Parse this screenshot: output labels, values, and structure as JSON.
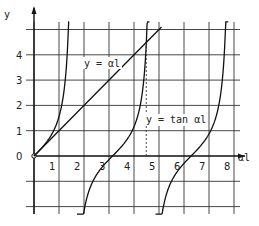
{
  "chart_data": {
    "type": "line",
    "title": "",
    "xlabel": "αl",
    "ylabel": "y",
    "xlim": [
      0,
      8.5
    ],
    "ylim": [
      -2,
      5.2
    ],
    "grid": true,
    "x_ticks": [
      "1",
      "2",
      "3",
      "4",
      "5",
      "6",
      "7",
      "8"
    ],
    "y_ticks": [
      "0",
      "1",
      "2",
      "3",
      "4"
    ],
    "series": [
      {
        "name": "y = αl",
        "kind": "line",
        "x": [
          0,
          5.1
        ],
        "y": [
          0,
          5.1
        ]
      },
      {
        "name": "y = tan αl",
        "kind": "tan",
        "branches": [
          [
            0,
            1.4
          ],
          [
            1.72,
            4.62
          ],
          [
            4.86,
            7.77
          ]
        ]
      }
    ],
    "annotations": [
      {
        "text": "y = αl",
        "x": 2.1,
        "y": 3.7
      },
      {
        "text": "y = tan αl",
        "x": 4.5,
        "y": 1.4
      },
      {
        "type": "dashed-vertical",
        "x": 4.49,
        "y_from": 0,
        "y_to": 4.49
      }
    ],
    "origin_label": "0"
  },
  "labels": {
    "y_axis": "y",
    "x_axis": "αl",
    "line_label": "y = αl",
    "tan_label": "y = tan αl",
    "origin": "0"
  }
}
